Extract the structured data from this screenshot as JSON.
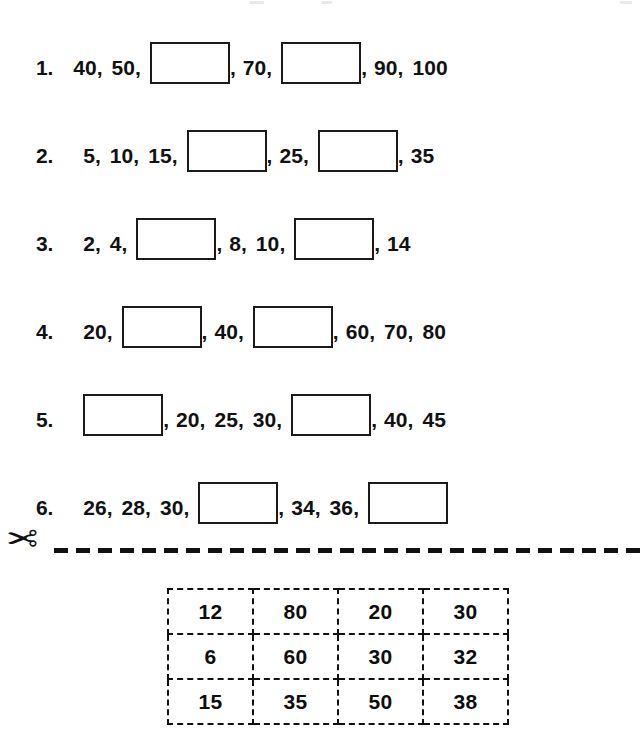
{
  "worksheet": {
    "problems": [
      {
        "number": "1.",
        "indent": 20,
        "items": [
          {
            "type": "number",
            "value": "40"
          },
          {
            "type": "number",
            "value": "50"
          },
          {
            "type": "box",
            "value": ""
          },
          {
            "type": "number",
            "value": "70"
          },
          {
            "type": "box",
            "value": ""
          },
          {
            "type": "number",
            "value": "90"
          },
          {
            "type": "number",
            "value": "100"
          }
        ]
      },
      {
        "number": "2.",
        "indent": 30,
        "items": [
          {
            "type": "number",
            "value": "5"
          },
          {
            "type": "number",
            "value": "10"
          },
          {
            "type": "number",
            "value": "15"
          },
          {
            "type": "box",
            "value": ""
          },
          {
            "type": "number",
            "value": "25"
          },
          {
            "type": "box",
            "value": ""
          },
          {
            "type": "number",
            "value": "35"
          }
        ]
      },
      {
        "number": "3.",
        "indent": 30,
        "items": [
          {
            "type": "number",
            "value": "2"
          },
          {
            "type": "number",
            "value": "4"
          },
          {
            "type": "box",
            "value": ""
          },
          {
            "type": "number",
            "value": "8"
          },
          {
            "type": "number",
            "value": "10"
          },
          {
            "type": "box",
            "value": ""
          },
          {
            "type": "number",
            "value": "14"
          }
        ]
      },
      {
        "number": "4.",
        "indent": 30,
        "items": [
          {
            "type": "number",
            "value": "20"
          },
          {
            "type": "box",
            "value": ""
          },
          {
            "type": "number",
            "value": "40"
          },
          {
            "type": "box",
            "value": ""
          },
          {
            "type": "number",
            "value": "60"
          },
          {
            "type": "number",
            "value": "70"
          },
          {
            "type": "number",
            "value": "80"
          }
        ]
      },
      {
        "number": "5.",
        "indent": 30,
        "items": [
          {
            "type": "box",
            "value": ""
          },
          {
            "type": "number",
            "value": "20"
          },
          {
            "type": "number",
            "value": "25"
          },
          {
            "type": "number",
            "value": "30"
          },
          {
            "type": "box",
            "value": ""
          },
          {
            "type": "number",
            "value": "40"
          },
          {
            "type": "number",
            "value": "45"
          }
        ]
      },
      {
        "number": "6.",
        "indent": 30,
        "items": [
          {
            "type": "number",
            "value": "26"
          },
          {
            "type": "number",
            "value": "28"
          },
          {
            "type": "number",
            "value": "30"
          },
          {
            "type": "box",
            "value": ""
          },
          {
            "type": "number",
            "value": "34"
          },
          {
            "type": "number",
            "value": "36"
          },
          {
            "type": "box",
            "value": ""
          }
        ]
      }
    ],
    "cut_line": {
      "icon": "scissors-icon",
      "glyph": "✂"
    },
    "answer_grid": {
      "rows": [
        [
          "12",
          "80",
          "20",
          "30"
        ],
        [
          "6",
          "60",
          "30",
          "32"
        ],
        [
          "15",
          "35",
          "50",
          "38"
        ]
      ]
    }
  }
}
